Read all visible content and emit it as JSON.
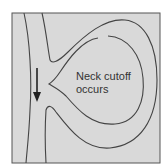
{
  "diagram": {
    "type": "river-meander-neck-cutoff",
    "label_line1": "Neck cutoff",
    "label_line2": "occurs",
    "flow_direction": "down",
    "colors": {
      "background": "#d9d9d9",
      "frame": "#555555",
      "lines": "#444444",
      "text": "#333333",
      "page": "#ffffff"
    }
  }
}
